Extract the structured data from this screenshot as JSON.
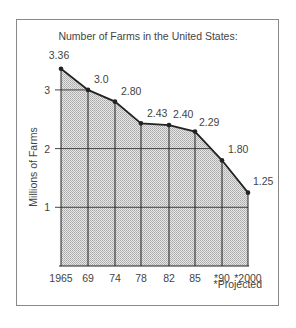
{
  "chart_data": {
    "type": "area",
    "title": "Number of Farms in the United States:",
    "xlabel": "",
    "ylabel": "Millions of Farms",
    "categories": [
      "1965",
      "69",
      "74",
      "78",
      "82",
      "85",
      "*90",
      "*2000"
    ],
    "series": [
      {
        "name": "Number of Farms (millions)",
        "values": [
          3.36,
          3.0,
          2.8,
          2.43,
          2.4,
          2.29,
          1.8,
          1.25
        ]
      }
    ],
    "value_labels": [
      "3.36",
      "3.0",
      "2.80",
      "2.43",
      "2.40",
      "2.29",
      "1.80",
      "1.25"
    ],
    "yticks": [
      "1",
      "2",
      "3"
    ],
    "ylim": [
      0,
      3.5
    ],
    "grid": true,
    "legend": null,
    "annotations": [
      "*Projected"
    ],
    "colors": {
      "line": "#222222",
      "fill": "#c8c8c8",
      "frame": "#888888"
    }
  }
}
